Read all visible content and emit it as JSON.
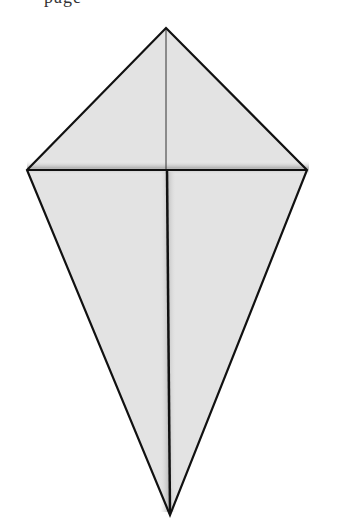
{
  "header": {
    "clipped_text": "page"
  },
  "diagram": {
    "fill_color": "#e2e2e2",
    "stroke_color": "#111111",
    "shade_color": "#b8b8b8",
    "points": {
      "top": [
        166,
        28
      ],
      "left": [
        27,
        170
      ],
      "right": [
        307,
        170
      ],
      "bottom": [
        170,
        515
      ],
      "center": [
        166,
        170
      ]
    }
  }
}
